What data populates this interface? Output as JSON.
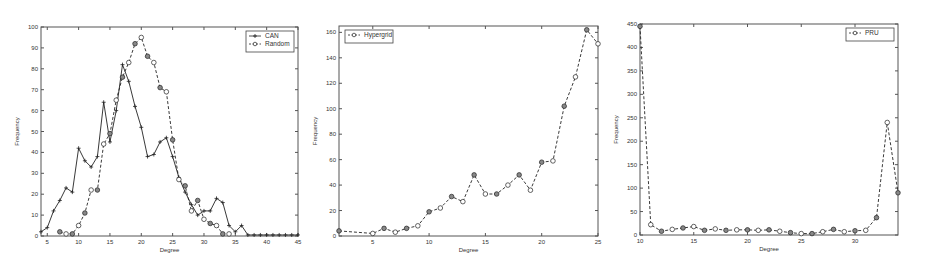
{
  "chart_data": [
    {
      "type": "line",
      "title": "",
      "xlabel": "Degree",
      "ylabel": "Frequency",
      "xlim": [
        4,
        45
      ],
      "ylim": [
        0,
        100
      ],
      "xticks": [
        5,
        10,
        15,
        20,
        25,
        30,
        35,
        40,
        45
      ],
      "yticks": [
        0,
        10,
        20,
        30,
        40,
        50,
        60,
        70,
        80,
        90,
        100
      ],
      "grid": false,
      "legend_position": "upper right",
      "series": [
        {
          "name": "CAN",
          "style": "solid",
          "marker": "+",
          "x": [
            4,
            5,
            6,
            7,
            8,
            9,
            10,
            11,
            12,
            13,
            14,
            15,
            16,
            17,
            18,
            19,
            20,
            21,
            22,
            23,
            24,
            25,
            26,
            27,
            28,
            29,
            30,
            31,
            32,
            33,
            34,
            35,
            36,
            37,
            38,
            39,
            40,
            41,
            42,
            43,
            44,
            45
          ],
          "y": [
            2,
            4,
            12,
            17,
            23,
            21,
            42,
            36,
            33,
            38,
            64,
            45,
            60,
            82,
            74,
            62,
            52,
            38,
            39,
            45,
            47,
            38,
            28,
            21,
            15,
            10,
            12,
            12,
            18,
            16,
            5,
            2,
            5,
            0.5,
            0.5,
            0.5,
            0.5,
            0.5,
            0.5,
            0.5,
            0.5,
            0.5
          ]
        },
        {
          "name": "Random",
          "style": "dashed",
          "marker": "o",
          "x": [
            7,
            8,
            9,
            10,
            11,
            12,
            13,
            14,
            15,
            16,
            17,
            18,
            19,
            20,
            21,
            22,
            23,
            24,
            25,
            26,
            27,
            28,
            29,
            30,
            31,
            32,
            33,
            34
          ],
          "y": [
            2,
            1,
            1,
            5,
            11,
            22,
            22,
            44,
            49,
            65,
            76,
            83,
            92,
            95,
            86,
            83,
            71,
            69,
            46,
            27,
            24,
            12,
            17,
            8,
            6,
            5,
            1,
            1
          ]
        }
      ]
    },
    {
      "type": "line",
      "title": "",
      "xlabel": "Degree",
      "ylabel": "Frequency",
      "xlim": [
        2,
        25
      ],
      "ylim": [
        0,
        165
      ],
      "xticks": [
        5,
        10,
        15,
        20,
        25
      ],
      "yticks": [
        0,
        20,
        40,
        60,
        80,
        100,
        120,
        140,
        160
      ],
      "grid": false,
      "legend_position": "upper left",
      "series": [
        {
          "name": "Hypergrid",
          "style": "dashed",
          "marker": "o",
          "x": [
            2,
            5,
            6,
            7,
            8,
            9,
            10,
            11,
            12,
            13,
            14,
            15,
            16,
            17,
            18,
            19,
            20,
            21,
            22,
            23,
            24,
            25
          ],
          "y": [
            4,
            2,
            6,
            3,
            6,
            8,
            19,
            22,
            31,
            27,
            48,
            33,
            33,
            40,
            48,
            36,
            58,
            59,
            102,
            125,
            162,
            151
          ]
        }
      ]
    },
    {
      "type": "line",
      "title": "",
      "xlabel": "Degree",
      "ylabel": "Frequency",
      "xlim": [
        10,
        34
      ],
      "ylim": [
        0,
        450
      ],
      "xticks": [
        10,
        15,
        20,
        25,
        30
      ],
      "yticks": [
        0,
        50,
        100,
        150,
        200,
        250,
        300,
        350,
        400,
        450
      ],
      "grid": false,
      "legend_position": "upper right",
      "series": [
        {
          "name": "PRU",
          "style": "dashed",
          "marker": "o",
          "x": [
            10,
            11,
            12,
            13,
            14,
            15,
            16,
            17,
            18,
            19,
            20,
            21,
            22,
            23,
            24,
            25,
            26,
            27,
            28,
            29,
            30,
            31,
            32,
            33,
            34
          ],
          "y": [
            445,
            22,
            8,
            12,
            15,
            18,
            10,
            13,
            10,
            11,
            11,
            10,
            11,
            8,
            5,
            3,
            3,
            7,
            12,
            7,
            9,
            10,
            37,
            240,
            90
          ]
        }
      ]
    }
  ],
  "panels": [
    {
      "x": 0,
      "width": 308,
      "plot": {
        "left": 41,
        "top": 27,
        "right": 298,
        "bottom": 236
      }
    },
    {
      "x": 308,
      "width": 305,
      "plot": {
        "left": 31,
        "top": 26,
        "right": 290,
        "bottom": 236
      }
    },
    {
      "x": 613,
      "width": 312,
      "plot": {
        "left": 27,
        "top": 24,
        "right": 285,
        "bottom": 235
      }
    }
  ]
}
